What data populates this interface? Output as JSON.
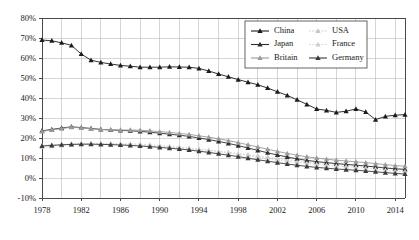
{
  "chart_data": {
    "type": "line",
    "title": "",
    "subtitle": "",
    "xlabel": "",
    "ylabel": "",
    "xlim": [
      1978,
      2015
    ],
    "ylim": [
      -0.1,
      0.8
    ],
    "grid": true,
    "legend_position": "top-right",
    "y_tick_labels": [
      "80%",
      "70%",
      "60%",
      "50%",
      "40%",
      "30%",
      "20%",
      "10%",
      "0%",
      "-10%"
    ],
    "y_tick_values": [
      0.8,
      0.7,
      0.6,
      0.5,
      0.4,
      0.3,
      0.2,
      0.1,
      0.0,
      -0.1
    ],
    "x_tick_labels": [
      "1978",
      "1982",
      "1986",
      "1990",
      "1994",
      "1998",
      "2002",
      "2006",
      "2010",
      "2014"
    ],
    "x_tick_values": [
      1978,
      1982,
      1986,
      1990,
      1994,
      1998,
      2002,
      2006,
      2010,
      2014
    ],
    "x_minor_gridline_step": 2,
    "x": [
      1978,
      1979,
      1980,
      1981,
      1982,
      1983,
      1984,
      1985,
      1986,
      1987,
      1988,
      1989,
      1990,
      1991,
      1992,
      1993,
      1994,
      1995,
      1996,
      1997,
      1998,
      1999,
      2000,
      2001,
      2002,
      2003,
      2004,
      2005,
      2006,
      2007,
      2008,
      2009,
      2010,
      2011,
      2012,
      2013,
      2014,
      2015
    ],
    "series": [
      {
        "name": "China",
        "color": "#1c1c1c",
        "marker": "triangle",
        "line_style": "solid",
        "values": [
          0.69,
          0.686,
          0.676,
          0.663,
          0.62,
          0.589,
          0.578,
          0.57,
          0.563,
          0.559,
          0.554,
          0.554,
          0.554,
          0.556,
          0.555,
          0.554,
          0.548,
          0.535,
          0.52,
          0.506,
          0.492,
          0.479,
          0.466,
          0.45,
          0.431,
          0.413,
          0.391,
          0.368,
          0.345,
          0.338,
          0.328,
          0.334,
          0.345,
          0.33,
          0.292,
          0.308,
          0.314,
          0.317
        ]
      },
      {
        "name": "USA",
        "color": "#c6c6c6",
        "marker": "triangle",
        "line_style": "dotted",
        "values": [
          0.163,
          0.166,
          0.168,
          0.17,
          0.172,
          0.173,
          0.172,
          0.17,
          0.168,
          0.166,
          0.164,
          0.162,
          0.158,
          0.154,
          0.15,
          0.146,
          0.142,
          0.138,
          0.133,
          0.128,
          0.122,
          0.116,
          0.11,
          0.104,
          0.098,
          0.092,
          0.086,
          0.081,
          0.077,
          0.073,
          0.07,
          0.067,
          0.064,
          0.06,
          0.056,
          0.052,
          0.048,
          0.046
        ]
      },
      {
        "name": "Japan",
        "color": "#2e2e2e",
        "marker": "triangle",
        "line_style": "solid",
        "values": [
          0.236,
          0.243,
          0.25,
          0.256,
          0.252,
          0.248,
          0.243,
          0.24,
          0.238,
          0.236,
          0.233,
          0.229,
          0.224,
          0.219,
          0.214,
          0.208,
          0.2,
          0.192,
          0.183,
          0.173,
          0.162,
          0.15,
          0.138,
          0.126,
          0.115,
          0.105,
          0.096,
          0.088,
          0.082,
          0.077,
          0.072,
          0.068,
          0.064,
          0.06,
          0.055,
          0.05,
          0.046,
          0.043
        ]
      },
      {
        "name": "France",
        "color": "#cfcfcf",
        "marker": "triangle",
        "line_style": "dotted",
        "values": [
          0.155,
          0.159,
          0.163,
          0.167,
          0.17,
          0.172,
          0.173,
          0.173,
          0.172,
          0.171,
          0.169,
          0.166,
          0.163,
          0.159,
          0.155,
          0.15,
          0.145,
          0.139,
          0.133,
          0.126,
          0.119,
          0.112,
          0.104,
          0.097,
          0.09,
          0.084,
          0.078,
          0.073,
          0.068,
          0.064,
          0.06,
          0.057,
          0.053,
          0.049,
          0.044,
          0.039,
          0.034,
          0.031
        ]
      },
      {
        "name": "Britain",
        "color": "#9a9a9a",
        "marker": "triangle",
        "line_style": "solid",
        "values": [
          0.233,
          0.24,
          0.247,
          0.254,
          0.25,
          0.246,
          0.243,
          0.241,
          0.24,
          0.24,
          0.239,
          0.236,
          0.232,
          0.228,
          0.223,
          0.218,
          0.211,
          0.204,
          0.196,
          0.187,
          0.177,
          0.166,
          0.155,
          0.144,
          0.133,
          0.123,
          0.114,
          0.106,
          0.1,
          0.094,
          0.089,
          0.085,
          0.081,
          0.077,
          0.072,
          0.067,
          0.062,
          0.059
        ]
      },
      {
        "name": "Germany",
        "color": "#3a3a3a",
        "marker": "triangle",
        "line_style": "solid",
        "values": [
          0.16,
          0.163,
          0.166,
          0.168,
          0.169,
          0.169,
          0.168,
          0.167,
          0.165,
          0.163,
          0.16,
          0.157,
          0.153,
          0.149,
          0.145,
          0.14,
          0.134,
          0.128,
          0.121,
          0.114,
          0.107,
          0.099,
          0.091,
          0.084,
          0.077,
          0.07,
          0.064,
          0.058,
          0.053,
          0.049,
          0.045,
          0.042,
          0.039,
          0.035,
          0.031,
          0.027,
          0.023,
          0.02
        ]
      }
    ],
    "legend_order": [
      "China",
      "USA",
      "Japan",
      "France",
      "Britain",
      "Germany"
    ]
  }
}
